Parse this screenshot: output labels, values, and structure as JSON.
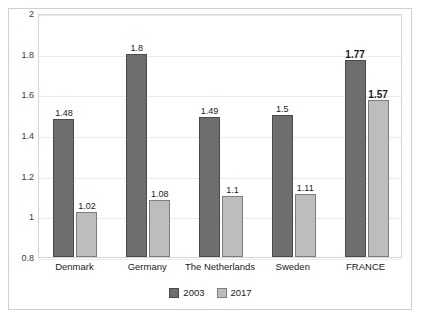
{
  "chart_data": {
    "type": "bar",
    "title": "",
    "subtitle": "",
    "xlabel": "",
    "ylabel": "",
    "categories": [
      "Denmark",
      "Germany",
      "The Netherlands",
      "Sweden",
      "FRANCE"
    ],
    "series": [
      {
        "name": "2003",
        "color": "#6e6e6e",
        "values": [
          1.48,
          1.8,
          1.49,
          1.5,
          1.77
        ],
        "labels": [
          "1.48",
          "1.8",
          "1.49",
          "1.5",
          "1.77"
        ]
      },
      {
        "name": "2017",
        "color": "#bdbdbd",
        "values": [
          1.02,
          1.08,
          1.1,
          1.11,
          1.57
        ],
        "labels": [
          "1.02",
          "1.08",
          "1.1",
          "1.11",
          "1.57"
        ]
      }
    ],
    "ylim": [
      0.8,
      2
    ],
    "yticks": [
      0.8,
      1,
      1.2,
      1.4,
      1.6,
      1.8,
      2
    ],
    "ytick_labels": [
      "0.8",
      "1",
      "1.2",
      "1.4",
      "1.6",
      "1.8",
      "2"
    ],
    "grid": true,
    "legend_position": "bottom",
    "highlight_category": "FRANCE",
    "highlight_bold_labels": [
      "1.77",
      "1.57"
    ]
  },
  "legend": {
    "items": [
      {
        "label": "2003",
        "swatch": "series-2003-swatch"
      },
      {
        "label": "2017",
        "swatch": "series-2017-swatch"
      }
    ]
  }
}
